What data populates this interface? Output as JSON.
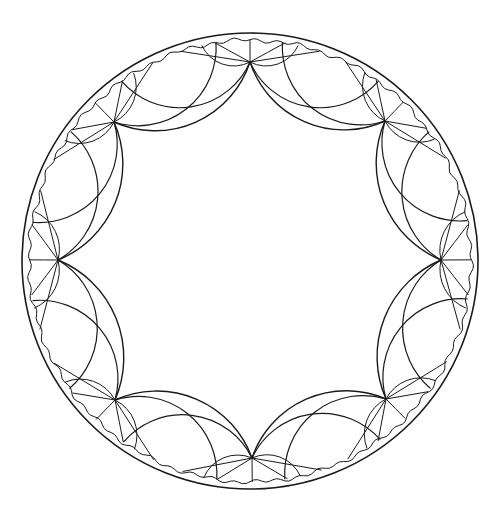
{
  "diagram": {
    "type": "hyperbolic-tiling-poincare-disk",
    "stroke_color": "#1a1a1a",
    "background": "#ffffff",
    "disk": {
      "cx": 250,
      "cy": 261,
      "r": 228
    },
    "inner_boundary_r": 221,
    "central_polygon_sides": 8,
    "vertices": [
      {
        "name": "top",
        "x": 250,
        "y": 62
      },
      {
        "name": "top-right",
        "x": 385,
        "y": 121
      },
      {
        "name": "right",
        "x": 441,
        "y": 260
      },
      {
        "name": "bottom-right",
        "x": 386,
        "y": 399
      },
      {
        "name": "bottom",
        "x": 252,
        "y": 458
      },
      {
        "name": "bottom-left",
        "x": 115,
        "y": 400
      },
      {
        "name": "left",
        "x": 58,
        "y": 260
      },
      {
        "name": "top-left",
        "x": 114,
        "y": 122
      }
    ],
    "fan_lines_per_vertex": 5
  }
}
